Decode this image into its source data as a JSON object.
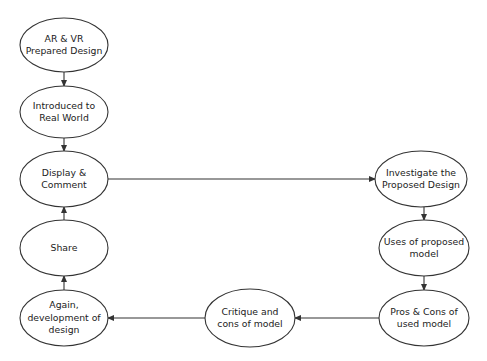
{
  "diagram": {
    "type": "flowchart",
    "stroke_color": "#333333",
    "text_color": "#222222",
    "background": "#ffffff",
    "nodes": [
      {
        "id": "n1",
        "label": "AR & VR\nPrepared Design",
        "cx": 64,
        "cy": 45,
        "rx": 44,
        "ry": 27
      },
      {
        "id": "n2",
        "label": "Introduced to\nReal World",
        "cx": 64,
        "cy": 112,
        "rx": 44,
        "ry": 26
      },
      {
        "id": "n3",
        "label": "Display &\nComment",
        "cx": 64,
        "cy": 179,
        "rx": 44,
        "ry": 28
      },
      {
        "id": "n4",
        "label": "Share",
        "cx": 64,
        "cy": 248,
        "rx": 44,
        "ry": 28
      },
      {
        "id": "n5",
        "label": "Again,\ndevelopment of\ndesign",
        "cx": 64,
        "cy": 318,
        "rx": 44,
        "ry": 28
      },
      {
        "id": "n6",
        "label": "Investigate the\nProposed Design",
        "cx": 421,
        "cy": 179,
        "rx": 46,
        "ry": 28
      },
      {
        "id": "n7",
        "label": "Uses of proposed\nmodel",
        "cx": 424,
        "cy": 248,
        "rx": 45,
        "ry": 28
      },
      {
        "id": "n8",
        "label": "Pros & Cons of\nused model",
        "cx": 424,
        "cy": 318,
        "rx": 45,
        "ry": 28
      },
      {
        "id": "n9",
        "label": "Critique and\ncons of model",
        "cx": 250,
        "cy": 318,
        "rx": 45,
        "ry": 29
      }
    ],
    "edges": [
      {
        "from": "n1",
        "to": "n2",
        "x1": 64,
        "y1": 72,
        "x2": 64,
        "y2": 86
      },
      {
        "from": "n2",
        "to": "n3",
        "x1": 64,
        "y1": 138,
        "x2": 64,
        "y2": 151
      },
      {
        "from": "n4",
        "to": "n3",
        "x1": 64,
        "y1": 220,
        "x2": 64,
        "y2": 207
      },
      {
        "from": "n5",
        "to": "n4",
        "x1": 64,
        "y1": 290,
        "x2": 64,
        "y2": 276
      },
      {
        "from": "n3",
        "to": "n6",
        "x1": 108,
        "y1": 179,
        "x2": 375,
        "y2": 179
      },
      {
        "from": "n6",
        "to": "n7",
        "x1": 424,
        "y1": 207,
        "x2": 424,
        "y2": 220
      },
      {
        "from": "n7",
        "to": "n8",
        "x1": 424,
        "y1": 276,
        "x2": 424,
        "y2": 290
      },
      {
        "from": "n8",
        "to": "n9",
        "x1": 379,
        "y1": 318,
        "x2": 295,
        "y2": 318
      },
      {
        "from": "n9",
        "to": "n5",
        "x1": 205,
        "y1": 318,
        "x2": 108,
        "y2": 318
      }
    ]
  }
}
